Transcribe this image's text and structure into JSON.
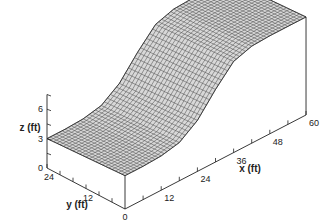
{
  "chart_data": {
    "type": "surface3d",
    "title": "",
    "xlabel": "x (ft)",
    "ylabel": "y (ft)",
    "zlabel": "z (ft)",
    "x_ticks": [
      0,
      12,
      24,
      36,
      48,
      60
    ],
    "x_tick_labels": [
      "0",
      "12",
      "24",
      "36",
      "48",
      "60"
    ],
    "y_ticks": [
      0,
      12,
      24
    ],
    "y_tick_labels": [
      "",
      "12",
      "24"
    ],
    "z_ticks": [
      0,
      3,
      6
    ],
    "z_tick_labels": [
      "0",
      "3",
      "6"
    ],
    "xlim": [
      0,
      60
    ],
    "ylim": [
      0,
      24
    ],
    "zlim": [
      0,
      7.5
    ],
    "surface_profile": {
      "x": [
        0,
        6,
        12,
        18,
        24,
        30,
        36,
        42,
        48,
        54,
        60
      ],
      "z_at_y0": [
        3.4,
        3.4,
        3.5,
        3.9,
        5.2,
        7.4,
        9.3,
        9.9,
        10.0,
        10.0,
        10.0
      ],
      "z_at_y24": [
        3.0,
        3.0,
        3.1,
        3.5,
        4.8,
        7.0,
        8.9,
        9.5,
        9.6,
        9.6,
        9.6
      ]
    },
    "grid": false,
    "wireframe_resolution": {
      "nx": 60,
      "ny": 24
    }
  }
}
